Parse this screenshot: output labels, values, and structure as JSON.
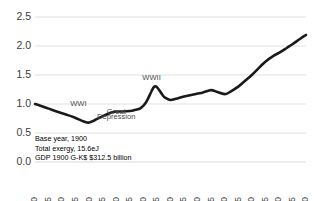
{
  "chart_data": {
    "type": "line",
    "title": "",
    "xlabel": "",
    "ylabel": "",
    "xlim": [
      1900,
      2000
    ],
    "ylim": [
      0.0,
      2.5
    ],
    "grid": true,
    "legend_position": "none",
    "y_ticks": [
      "0.0",
      "0.5",
      "1.0",
      "1.5",
      "2.0",
      "2.5"
    ],
    "y_tick_values": [
      0.0,
      0.5,
      1.0,
      1.5,
      2.0,
      2.5
    ],
    "x_ticks": [
      "1900",
      "1905",
      "1910",
      "1915",
      "1920",
      "1925",
      "1930",
      "1935",
      "1940",
      "1945",
      "1950",
      "1955",
      "1960",
      "1965",
      "1970",
      "1975",
      "1980",
      "1985",
      "1990",
      "1995",
      "2000"
    ],
    "series": [
      {
        "name": "Exergy to GDP ratio index",
        "color": "#1a1a1a",
        "x": [
          1900,
          1902,
          1905,
          1908,
          1910,
          1912,
          1915,
          1918,
          1920,
          1922,
          1925,
          1928,
          1930,
          1932,
          1935,
          1937,
          1939,
          1941,
          1943,
          1944,
          1945,
          1947,
          1948,
          1950,
          1952,
          1955,
          1958,
          1960,
          1962,
          1965,
          1967,
          1970,
          1972,
          1975,
          1978,
          1980,
          1983,
          1985,
          1988,
          1990,
          1993,
          1995,
          1998,
          2000
        ],
        "values": [
          1.0,
          0.97,
          0.92,
          0.87,
          0.84,
          0.81,
          0.76,
          0.7,
          0.68,
          0.72,
          0.79,
          0.85,
          0.87,
          0.87,
          0.88,
          0.9,
          0.93,
          1.03,
          1.22,
          1.3,
          1.29,
          1.16,
          1.11,
          1.07,
          1.09,
          1.13,
          1.16,
          1.18,
          1.2,
          1.24,
          1.21,
          1.17,
          1.21,
          1.3,
          1.42,
          1.5,
          1.64,
          1.73,
          1.83,
          1.88,
          1.97,
          2.03,
          2.13,
          2.19
        ]
      }
    ],
    "annotations": [
      {
        "text": "WWI",
        "x": 1916,
        "y": 0.96
      },
      {
        "text": "Great",
        "x": 1930,
        "y": 0.82
      },
      {
        "text": "Depression",
        "x": 1930,
        "y": 0.74
      },
      {
        "text": "WWII",
        "x": 1943,
        "y": 1.42
      }
    ]
  },
  "notes": {
    "line1": "Base year, 1900",
    "line2": "Total exergy, 15.6eJ",
    "line3": "GDP 1900 G-K$ $312.5 billion"
  }
}
